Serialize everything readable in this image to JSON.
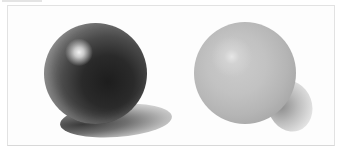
{
  "image": {
    "description": "Two shaded spheres drawing illustration on white background",
    "spheres": [
      {
        "name": "dark-glossy-sphere",
        "tone": "dark",
        "highlight": "upper-left",
        "shadow": "cast ellipse lower-right"
      },
      {
        "name": "light-matte-sphere",
        "tone": "light gray",
        "highlight": "upper-left",
        "shadow": "soft lower-right"
      }
    ],
    "colors": {
      "background": "#ffffff",
      "frame_border": "#e2e2e2",
      "dark_sphere_core": "#1d1d1d",
      "dark_sphere_rim": "#b5b5b5",
      "light_sphere_body": "#c2c2c2",
      "light_sphere_edge": "#9d9d9d"
    }
  }
}
